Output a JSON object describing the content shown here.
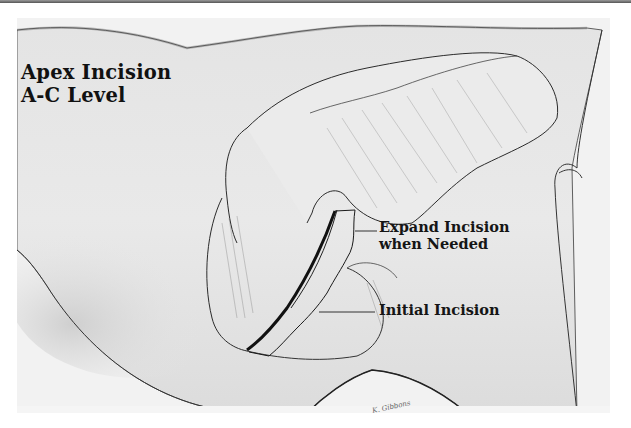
{
  "figure": {
    "title_lines": [
      "Apex Incision",
      "A-C Level"
    ],
    "labels": {
      "expand": [
        "Expand Incision",
        "when Needed"
      ],
      "initial": "Initial Incision"
    },
    "signature": "K. Gibbons",
    "colors": {
      "background": "#ffffff",
      "skin_shade": "#e6e6e6",
      "line": "#1a1a1a",
      "text": "#111111"
    }
  }
}
